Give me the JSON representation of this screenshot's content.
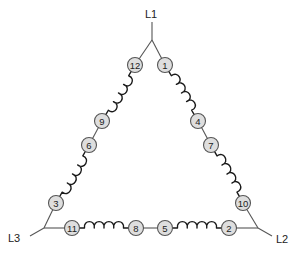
{
  "diagram": {
    "title": "",
    "type": "delta-connected 12-lead motor winding",
    "lines": [
      {
        "id": "L1",
        "label": "L1",
        "x": 145,
        "y": 14,
        "junction": [
          152,
          40
        ],
        "lead_from": [
          152,
          22
        ]
      },
      {
        "id": "L2",
        "label": "L2",
        "x": 276,
        "y": 239,
        "junction": [
          258,
          228
        ],
        "lead_from": [
          272,
          236
        ]
      },
      {
        "id": "L3",
        "label": "L3",
        "x": 8,
        "y": 238,
        "junction": [
          44,
          228
        ],
        "lead_from": [
          30,
          236
        ]
      }
    ],
    "terminals": [
      {
        "label": "1",
        "x": 165,
        "y": 65
      },
      {
        "label": "4",
        "x": 198,
        "y": 121
      },
      {
        "label": "7",
        "x": 211,
        "y": 145
      },
      {
        "label": "10",
        "x": 243,
        "y": 203
      },
      {
        "label": "12",
        "x": 135,
        "y": 65
      },
      {
        "label": "9",
        "x": 102,
        "y": 121
      },
      {
        "label": "6",
        "x": 89,
        "y": 145
      },
      {
        "label": "3",
        "x": 56,
        "y": 203
      },
      {
        "label": "11",
        "x": 72,
        "y": 228
      },
      {
        "label": "8",
        "x": 136,
        "y": 228
      },
      {
        "label": "5",
        "x": 165,
        "y": 228
      },
      {
        "label": "2",
        "x": 229,
        "y": 228
      }
    ],
    "coils": [
      {
        "from": "1",
        "to": "4"
      },
      {
        "from": "7",
        "to": "10"
      },
      {
        "from": "12",
        "to": "9"
      },
      {
        "from": "6",
        "to": "3"
      },
      {
        "from": "11",
        "to": "8"
      },
      {
        "from": "5",
        "to": "2"
      }
    ],
    "straight_links": [
      {
        "from": "4",
        "to": "7"
      },
      {
        "from": "9",
        "to": "6"
      },
      {
        "from": "8",
        "to": "5"
      }
    ],
    "colors": {
      "terminal_fill": "#dedede",
      "terminal_stroke": "#555555",
      "coil": "#1a1a1a",
      "wire": "#555555"
    }
  }
}
